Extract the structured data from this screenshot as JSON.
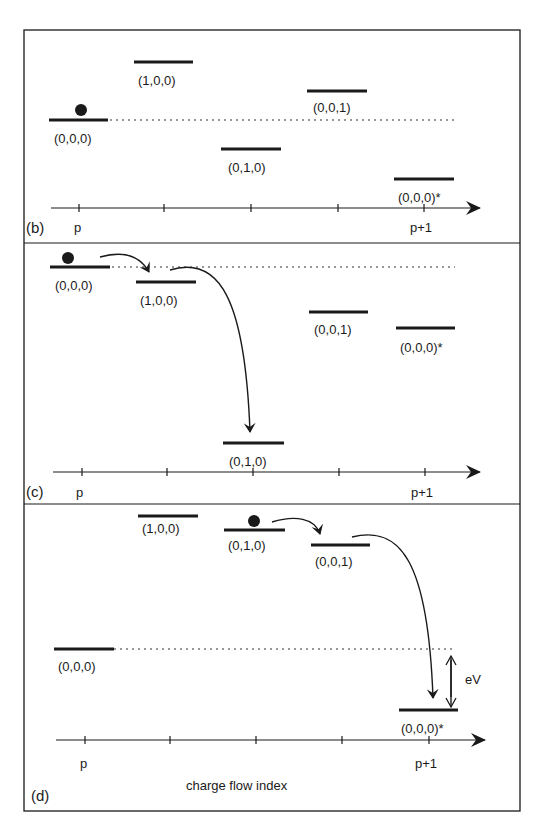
{
  "figure": {
    "panels": [
      {
        "id": "b",
        "label": "(b)",
        "axis": {
          "start_label": "p",
          "end_label": "p+1"
        },
        "levels": [
          {
            "name": "(0,0,0)",
            "occupied": true
          },
          {
            "name": "(1,0,0)"
          },
          {
            "name": "(0,1,0)"
          },
          {
            "name": "(0,0,1)"
          },
          {
            "name": "(0,0,0)*"
          }
        ]
      },
      {
        "id": "c",
        "label": "(c)",
        "axis": {
          "start_label": "p",
          "end_label": "p+1"
        },
        "levels": [
          {
            "name": "(0,0,0)",
            "occupied": true
          },
          {
            "name": "(1,0,0)"
          },
          {
            "name": "(0,1,0)"
          },
          {
            "name": "(0,0,1)"
          },
          {
            "name": "(0,0,0)*"
          }
        ]
      },
      {
        "id": "d",
        "label": "(d)",
        "axis": {
          "start_label": "p",
          "end_label": "p+1",
          "title": "charge flow index"
        },
        "levels": [
          {
            "name": "(0,0,0)"
          },
          {
            "name": "(1,0,0)"
          },
          {
            "name": "(0,1,0)",
            "occupied": true
          },
          {
            "name": "(0,0,1)"
          },
          {
            "name": "(0,0,0)*"
          }
        ],
        "energy_gap_label": "eV"
      }
    ],
    "colors": {
      "ink": "#1a1a1a",
      "background": "#ffffff"
    }
  }
}
